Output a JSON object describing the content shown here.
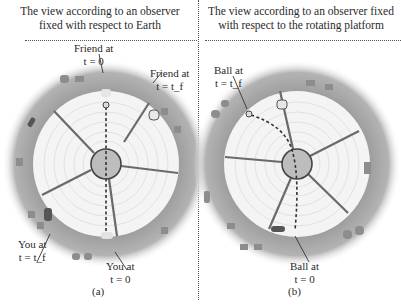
{
  "panels": {
    "a": {
      "title_line1": "The view according to an observer",
      "title_line2": "fixed with respect to Earth",
      "caption": "(a)",
      "labels": {
        "friend_t0": {
          "line1": "Friend at",
          "line2": "t = 0"
        },
        "friend_tf": {
          "line1": "Friend at",
          "line2": "t = t_f"
        },
        "you_tf": {
          "line1": "You at",
          "line2": "t = t_f"
        },
        "you_t0": {
          "line1": "You at",
          "line2": "t = 0"
        }
      }
    },
    "b": {
      "title_line1": "The view according to an observer fixed",
      "title_line2": "with respect to the rotating platform",
      "caption": "(b)",
      "labels": {
        "ball_tf": {
          "line1": "Ball at",
          "line2": "t = t_f"
        },
        "ball_t0": {
          "line1": "Ball at",
          "line2": "t = 0"
        }
      }
    }
  },
  "colors": {
    "outer_ring": "#a9a9a9",
    "ring_fade": "#d0d0d0",
    "platform": "#f4f4f4",
    "grid": "#dcdcdc",
    "hub": "#bdbdbd",
    "spoke": "#6a6a6a",
    "path": "#333333",
    "divider": "#555555"
  }
}
